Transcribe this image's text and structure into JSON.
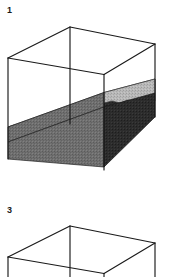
{
  "figure": {
    "width": 173,
    "height": 277,
    "background_color": "#ffffff",
    "line_color": "#1a1a1a"
  },
  "panels": [
    {
      "label": "1",
      "has_sediment_layer": true,
      "sediment": {
        "top_surface_color": "#b4b4b4",
        "front_face_color": "#6e6e6e",
        "right_face_color": "#2b2b2b",
        "top_surface_name": "sediment-top-surface",
        "front_face_name": "sediment-front-face",
        "right_face_name": "sediment-right-face",
        "fill_style": "stippled-gray",
        "top_edge_style": "irregular-wavy"
      }
    },
    {
      "label": "3",
      "has_sediment_layer": false,
      "sediment": null
    }
  ],
  "colors": {
    "outline": "#1a1a1a",
    "light_gray": "#b4b4b4",
    "mid_gray": "#6e6e6e",
    "dark_gray": "#2b2b2b",
    "white": "#ffffff"
  }
}
